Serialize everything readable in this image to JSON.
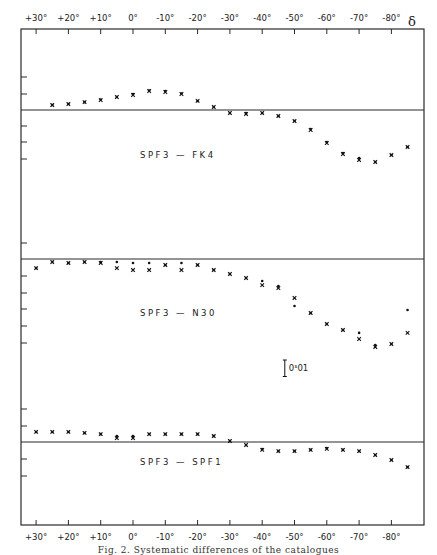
{
  "chart_data": {
    "type": "scatter",
    "title": "",
    "xlabel": "δ",
    "ylabel": "",
    "x_ticks": [
      "+30°",
      "+20°",
      "+10°",
      "0°",
      "-10°",
      "-20°",
      "-30°",
      "-40°",
      "-50°",
      "-60°",
      "-70°",
      "-80°"
    ],
    "x_tick_values": [
      30,
      20,
      10,
      0,
      -10,
      -20,
      -30,
      -40,
      -50,
      -60,
      -70,
      -80
    ],
    "xlim": [
      35,
      -88
    ],
    "grid": false,
    "scale_bar": {
      "label": "0ˢ01",
      "value": 0.01,
      "x": -47
    },
    "panels": [
      {
        "name": "SPF3 - FK4",
        "label": "SPF3 — FK4",
        "unit": "s",
        "x": [
          25,
          20,
          15,
          10,
          5,
          0,
          -5,
          -10,
          -15,
          -20,
          -25,
          -30,
          -35,
          -40,
          -45,
          -50,
          -55,
          -60,
          -65,
          -70,
          -75,
          -80,
          -85
        ],
        "series": [
          {
            "name": "x",
            "values": [
              0.003,
              0.0036,
              0.0048,
              0.006,
              0.0079,
              0.0091,
              0.0115,
              0.0109,
              0.0097,
              0.0055,
              0.0018,
              -0.0018,
              -0.0024,
              -0.0018,
              -0.0036,
              -0.0067,
              -0.0121,
              -0.02,
              -0.0267,
              -0.0303,
              -0.0315,
              -0.0273,
              -0.0224
            ]
          },
          {
            "name": "dot",
            "values": [
              0.003,
              0.0036,
              0.0048,
              0.0064,
              0.0079,
              0.0097,
              0.0118,
              0.0115,
              0.01,
              0.0055,
              0.0018,
              -0.0018,
              -0.0018,
              -0.0018,
              -0.0036,
              -0.0067,
              -0.0115,
              -0.0194,
              -0.0261,
              -0.0291,
              -0.0315,
              -0.0273,
              -0.0224
            ]
          }
        ]
      },
      {
        "name": "SPF3 - N30",
        "label": "SPF3 — N30",
        "unit": "s",
        "x": [
          30,
          25,
          20,
          15,
          10,
          5,
          0,
          -5,
          -10,
          -15,
          -20,
          -25,
          -30,
          -35,
          -40,
          -45,
          -50,
          -55,
          -60,
          -65,
          -70,
          -75,
          -80,
          -85
        ],
        "series": [
          {
            "name": "x",
            "values": [
              -0.0055,
              -0.0018,
              -0.0024,
              -0.0018,
              -0.0024,
              -0.0055,
              -0.0067,
              -0.0067,
              -0.0036,
              -0.0067,
              -0.0036,
              -0.0067,
              -0.0091,
              -0.0115,
              -0.0158,
              -0.0176,
              -0.0236,
              -0.0327,
              -0.0394,
              -0.043,
              -0.0485,
              -0.0533,
              -0.0515,
              -0.0448
            ]
          },
          {
            "name": "dot",
            "values": [
              -0.0055,
              -0.0018,
              -0.0024,
              -0.0018,
              -0.0018,
              -0.0018,
              -0.0024,
              -0.0024,
              -0.0036,
              -0.0024,
              -0.0036,
              -0.0067,
              -0.0091,
              -0.0115,
              -0.0133,
              -0.0164,
              -0.0285,
              -0.0327,
              -0.0394,
              -0.043,
              -0.0448,
              -0.0521,
              -0.0515,
              -0.0309
            ]
          }
        ]
      },
      {
        "name": "SPF3 - SPF1",
        "label": "SPF3 — SPF1",
        "unit": "s",
        "x": [
          30,
          25,
          20,
          15,
          10,
          5,
          0,
          -5,
          -10,
          -15,
          -20,
          -25,
          -30,
          -35,
          -40,
          -45,
          -50,
          -55,
          -60,
          -65,
          -70,
          -75,
          -80,
          -85
        ],
        "series": [
          {
            "name": "x",
            "values": [
              0.0061,
              0.0061,
              0.0061,
              0.0055,
              0.0048,
              0.0024,
              0.0024,
              0.0048,
              0.0048,
              0.0048,
              0.0048,
              0.0036,
              0.0006,
              -0.0018,
              -0.0048,
              -0.0055,
              -0.0055,
              -0.0048,
              -0.0042,
              -0.0048,
              -0.0055,
              -0.0079,
              -0.0109,
              -0.0152
            ]
          },
          {
            "name": "dot",
            "values": [
              0.0061,
              0.0061,
              0.0061,
              0.0055,
              0.0048,
              0.0036,
              0.0036,
              0.0048,
              0.0048,
              0.0048,
              0.0048,
              0.0036,
              0.0006,
              -0.0018,
              -0.0042,
              -0.0055,
              -0.0055,
              -0.0048,
              -0.0036,
              -0.0048,
              -0.0055,
              -0.0079,
              -0.0109,
              -0.0152
            ]
          }
        ]
      }
    ]
  },
  "figure": {
    "x_axis_symbol": "δ",
    "top_ticks": [
      "+30°",
      "+20°",
      "+10°",
      "0°",
      "-10°",
      "-20°",
      "-30°",
      "-40°",
      "-50°",
      "-60°",
      "-70°",
      "-80°"
    ],
    "bottom_ticks": [
      "+30°",
      "+20°",
      "+10°",
      "0°",
      "-10°",
      "-20°",
      "-30°",
      "-40°",
      "-50°",
      "-60°",
      "-70°",
      "-80°"
    ],
    "panel_labels": [
      "SPF3 — FK4",
      "SPF3 — N30",
      "SPF3 — SPF1"
    ],
    "scale_bar_label": "0ˢ01",
    "caption": "Fig. 2.  Systematic differences of the catalogues"
  }
}
